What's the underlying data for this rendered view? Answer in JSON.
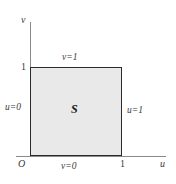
{
  "figure": {
    "width": 176,
    "height": 184,
    "background_color": "#ffffff",
    "axis_color": "#8a8a8a",
    "region_fill_color": "#e9e9e9",
    "region_border_color": "#2b2b2b",
    "text_color": "#3a3a3a"
  },
  "axes": {
    "vertical": {
      "name": "v"
    },
    "horizontal": {
      "name": "u"
    },
    "origin_label": "O"
  },
  "ticks": {
    "vertical": [
      {
        "label": "1",
        "value": 1
      }
    ],
    "horizontal": [
      {
        "label": "1",
        "value": 1
      }
    ]
  },
  "region": {
    "letter": "S",
    "edges": {
      "top": "v=1",
      "bottom": "v=0",
      "left": "u=0",
      "right": "u=1"
    }
  },
  "chart_data": {
    "type": "scatter",
    "title": "",
    "xlabel": "u",
    "ylabel": "v",
    "xlim": [
      0,
      1.45
    ],
    "ylim": [
      0,
      1.5
    ],
    "grid": false,
    "legend": null,
    "shapes": [
      {
        "kind": "rectangle",
        "label": "S",
        "x": [
          0,
          1
        ],
        "y": [
          0,
          1
        ],
        "fill": "#e9e9e9",
        "edge": "#2b2b2b"
      }
    ],
    "annotations": [
      {
        "text": "v=1",
        "x": 0.5,
        "y": 1.12,
        "anchor": "top-edge"
      },
      {
        "text": "v=0",
        "x": 0.5,
        "y": -0.1,
        "anchor": "bottom-edge"
      },
      {
        "text": "u=0",
        "x": -0.2,
        "y": 0.5,
        "anchor": "left-edge"
      },
      {
        "text": "u=1",
        "x": 1.12,
        "y": 0.5,
        "anchor": "right-edge"
      },
      {
        "text": "S",
        "x": 0.5,
        "y": 0.5,
        "anchor": "region-center"
      }
    ],
    "xticks": [
      1
    ],
    "xticklabels": [
      "1"
    ],
    "yticks": [
      1
    ],
    "yticklabels": [
      "1"
    ]
  }
}
